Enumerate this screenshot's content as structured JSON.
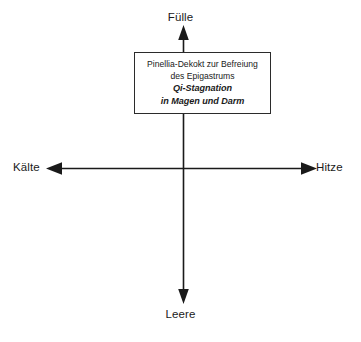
{
  "diagram": {
    "type": "four-quadrant-axis-diagram",
    "background_color": "#ffffff",
    "line_color": "#1a1a1a",
    "axes": {
      "vertical": {
        "top_label": "Fülle",
        "bottom_label": "Leere"
      },
      "horizontal": {
        "left_label": "Kälte",
        "right_label": "Hitze"
      }
    },
    "box": {
      "border_color": "#2b2b2b",
      "fill_color": "#ffffff",
      "lines": [
        {
          "text": "Pinellia-Dekokt zur Befreiung",
          "emphasis": false
        },
        {
          "text": "des Epigastrums",
          "emphasis": false
        },
        {
          "text": "Qi-Stagnation",
          "emphasis": true
        },
        {
          "text": "in Magen und Darm",
          "emphasis": true
        }
      ]
    }
  }
}
